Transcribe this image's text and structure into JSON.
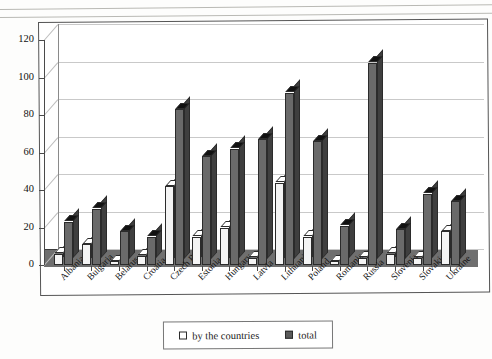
{
  "chart_data": {
    "type": "bar",
    "title": "",
    "xlabel": "",
    "ylabel": "",
    "ylim": [
      0,
      130
    ],
    "yticks": [
      0,
      20,
      40,
      60,
      80,
      100,
      120
    ],
    "grid": true,
    "legend_position": "bottom",
    "style": "3d-column",
    "categories": [
      "Albania",
      "Bulgaria",
      "Belarus",
      "Croatia",
      "Czech Rep.",
      "Estonia",
      "Hungary",
      "Latvia",
      "Lithuania",
      "Poland",
      "Romania",
      "Russia",
      "Slovenia",
      "Slovakia",
      "Ukraine"
    ],
    "series": [
      {
        "name": "by the countries",
        "color": "#f4f4f4",
        "values": [
          6,
          11,
          2,
          5,
          42,
          15,
          20,
          4,
          44,
          15,
          2,
          4,
          6,
          4,
          18
        ]
      },
      {
        "name": "total",
        "color": "#6a6a6a",
        "values": [
          23,
          30,
          18,
          15,
          83,
          58,
          62,
          67,
          92,
          66,
          21,
          108,
          19,
          38,
          34
        ]
      }
    ]
  },
  "legend": {
    "items": [
      {
        "label": "by the countries",
        "swatch": "light"
      },
      {
        "label": "total",
        "swatch": "dark"
      }
    ]
  }
}
